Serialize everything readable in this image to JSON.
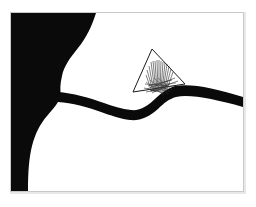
{
  "artwork": {
    "title": "Abstract Black and White Composition",
    "caption": "",
    "medium": "ink drawing",
    "orientation": "landscape",
    "background_color": "#ffffff",
    "ink_color": "#0a0a0a",
    "frame": {
      "color": "#c9c9c9",
      "shadow_color": "#e3e3e3",
      "stroke_width": 1,
      "left": 10,
      "top": 12,
      "right": 244,
      "bottom": 192
    },
    "canvas": {
      "width": 256,
      "height": 207
    },
    "shapes": [
      {
        "name": "left-black-mass",
        "type": "filled-polygon",
        "color": "#0a0a0a",
        "description": "Large black mass occupying the left side, concave right boundary"
      },
      {
        "name": "dark-band",
        "type": "filled-polygon",
        "color": "#0a0a0a",
        "description": "Tapering dark band sweeping from left mass rightward, peaking near triangle then descending to right frame edge"
      },
      {
        "name": "outlined-triangle",
        "type": "stroked-polygon",
        "color": "#1a1a1a",
        "stroke_width": 1,
        "vertices": "152,49 185,84 133,92",
        "description": "Thin outlined triangle overlapping the band peak"
      },
      {
        "name": "scribble-lines",
        "type": "stroked-lines",
        "color": "#2a2a2a",
        "stroke_width": 0.6,
        "count": 22,
        "description": "Bundle of near-vertical thin lines converging toward a lower point inside the triangle"
      }
    ]
  }
}
